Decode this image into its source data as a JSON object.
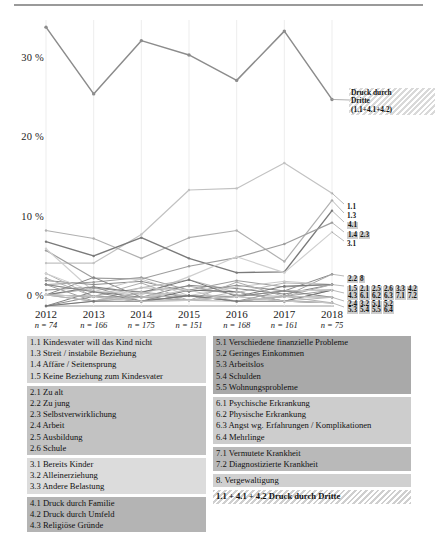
{
  "chart_data": {
    "type": "line",
    "title": "",
    "xlabel": "",
    "ylabel": "",
    "ylim": [
      0,
      36
    ],
    "yticks": [
      0,
      10,
      20,
      30
    ],
    "ytick_labels": [
      "0 %",
      "10 %",
      "20 %",
      "30 %"
    ],
    "grid": false,
    "legend_position": "below",
    "x": [
      "2012",
      "2013",
      "2014",
      "2015",
      "2016",
      "2017",
      "2018"
    ],
    "x_sublabels": [
      "n = 74",
      "n = 166",
      "n = 175",
      "n = 151",
      "n = 168",
      "n = 161",
      "n = 75"
    ],
    "annotations": [
      {
        "text_lines": [
          "Druck durch",
          "Dritte",
          "(1.1+4.1+4.2)"
        ],
        "points_to": "2018",
        "style": "hatched-box"
      }
    ],
    "end_labels": [
      {
        "codes": [
          "1.1"
        ],
        "value": 14.2,
        "style": "plain"
      },
      {
        "codes": [
          "1.3"
        ],
        "value": 13.3,
        "style": "plain"
      },
      {
        "codes": [
          "4.1"
        ],
        "value": 12.0,
        "style": "shaded"
      },
      {
        "codes": [
          "1.4",
          "2.3"
        ],
        "value": 10.5,
        "style": "shaded"
      },
      {
        "codes": [
          "3.1"
        ],
        "value": 9.3,
        "style": "plain"
      },
      {
        "codes": [
          "2.2",
          "8"
        ],
        "value": 4.0,
        "style": "shaded"
      },
      {
        "codes": [
          "1.5",
          "2.1",
          "2.5",
          "2.6",
          "3.3",
          "4.2"
        ],
        "value": 2.7,
        "style": "shaded"
      },
      {
        "codes": [
          "4.3",
          "6.1",
          "6.2",
          "6.3",
          "7.1",
          "7.2"
        ],
        "value": 2.0,
        "style": "shaded"
      },
      {
        "codes": [
          "2.4",
          "3.2",
          "5.1",
          "5.2"
        ],
        "value": 1.1,
        "style": "shaded"
      },
      {
        "codes": [
          "5.3",
          "5.4",
          "5.5",
          "6.4"
        ],
        "value": 0.4,
        "style": "shaded"
      }
    ],
    "series": [
      {
        "name": "Druck durch Dritte (1.1+4.1+4.2)",
        "color": "#8c8c8c",
        "width": 1.5,
        "values": [
          35.1,
          26.7,
          33.4,
          31.6,
          28.4,
          34.6,
          26.0
        ]
      },
      {
        "name": "1.1",
        "color": "#c2c2c2",
        "width": 1.2,
        "values": [
          5.4,
          5.4,
          9.0,
          14.6,
          14.8,
          18.0,
          14.2
        ]
      },
      {
        "name": "1.3",
        "color": "#b0b0b0",
        "width": 1.2,
        "values": [
          9.5,
          8.5,
          6.0,
          8.6,
          9.5,
          5.6,
          13.3
        ]
      },
      {
        "name": "4.1",
        "color": "#7a7a7a",
        "width": 1.4,
        "values": [
          8.1,
          6.3,
          8.6,
          6.0,
          4.2,
          4.3,
          12.0
        ]
      },
      {
        "name": "1.4 / 2.3",
        "color": "#9e9e9e",
        "width": 1.2,
        "values": [
          7.0,
          3.5,
          3.4,
          5.0,
          6.1,
          7.8,
          10.5
        ]
      },
      {
        "name": "3.1",
        "color": "#cfcfcf",
        "width": 1.2,
        "values": [
          7.2,
          1.8,
          1.4,
          3.7,
          6.2,
          4.2,
          9.3
        ]
      },
      {
        "name": "2.2",
        "color": "#8a8a8a",
        "width": 1.0,
        "values": [
          3.2,
          2.7,
          3.1,
          1.8,
          2.6,
          1.9,
          4.0
        ]
      },
      {
        "name": "8",
        "color": "#a5a5a5",
        "width": 1.0,
        "values": [
          1.4,
          2.2,
          1.8,
          2.5,
          1.4,
          1.2,
          4.0
        ]
      },
      {
        "name": "1.5",
        "color": "#9c9c9c",
        "width": 1.0,
        "values": [
          2.7,
          3.0,
          3.6,
          2.0,
          3.2,
          2.4,
          2.7
        ]
      },
      {
        "name": "2.1",
        "color": "#b5b5b5",
        "width": 1.0,
        "values": [
          4.1,
          1.2,
          2.3,
          3.3,
          1.7,
          2.9,
          2.7
        ]
      },
      {
        "name": "2.5",
        "color": "#868686",
        "width": 1.0,
        "values": [
          1.4,
          3.6,
          1.1,
          2.6,
          2.2,
          1.5,
          2.7
        ]
      },
      {
        "name": "2.6",
        "color": "#c8c8c8",
        "width": 1.0,
        "values": [
          2.7,
          1.8,
          3.4,
          1.3,
          2.4,
          3.1,
          2.7
        ]
      },
      {
        "name": "3.3",
        "color": "#777777",
        "width": 1.0,
        "values": [
          1.4,
          2.4,
          1.7,
          3.3,
          1.2,
          2.5,
          2.7
        ]
      },
      {
        "name": "4.2",
        "color": "#aeaeae",
        "width": 1.0,
        "values": [
          3.5,
          1.2,
          2.9,
          0.7,
          3.0,
          1.2,
          2.7
        ]
      },
      {
        "name": "4.3",
        "color": "#929292",
        "width": 1.0,
        "values": [
          2.0,
          2.4,
          0.6,
          1.3,
          0.6,
          1.9,
          2.0
        ]
      },
      {
        "name": "6.1",
        "color": "#bfbfbf",
        "width": 1.0,
        "values": [
          1.4,
          0.6,
          2.3,
          2.0,
          1.8,
          0.6,
          2.0
        ]
      },
      {
        "name": "6.2",
        "color": "#808080",
        "width": 1.0,
        "values": [
          0.0,
          1.8,
          1.1,
          0.7,
          1.2,
          1.9,
          2.0
        ]
      },
      {
        "name": "6.3",
        "color": "#a0a0a0",
        "width": 1.0,
        "values": [
          2.7,
          0.6,
          1.7,
          1.3,
          0.6,
          1.2,
          2.0
        ]
      },
      {
        "name": "7.1",
        "color": "#6e6e6e",
        "width": 1.0,
        "values": [
          1.4,
          1.2,
          0.6,
          2.0,
          1.8,
          0.6,
          2.0
        ]
      },
      {
        "name": "7.2",
        "color": "#d0d0d0",
        "width": 1.0,
        "values": [
          4.1,
          1.8,
          1.7,
          0.7,
          1.2,
          1.9,
          2.0
        ]
      },
      {
        "name": "2.4",
        "color": "#999999",
        "width": 1.0,
        "values": [
          1.4,
          1.2,
          1.1,
          1.3,
          0.6,
          1.2,
          1.1
        ]
      },
      {
        "name": "3.2",
        "color": "#b8b8b8",
        "width": 1.0,
        "values": [
          0.0,
          0.6,
          1.7,
          0.7,
          1.8,
          0.6,
          1.1
        ]
      },
      {
        "name": "5.1",
        "color": "#858585",
        "width": 1.0,
        "values": [
          2.7,
          1.8,
          0.6,
          1.3,
          1.2,
          1.9,
          1.1
        ]
      },
      {
        "name": "5.2",
        "color": "#c4c4c4",
        "width": 1.0,
        "values": [
          1.4,
          0.6,
          1.1,
          2.0,
          0.6,
          1.2,
          1.1
        ]
      },
      {
        "name": "5.3",
        "color": "#8f8f8f",
        "width": 1.0,
        "values": [
          0.0,
          1.2,
          0.6,
          0.7,
          1.2,
          0.6,
          0.4
        ]
      },
      {
        "name": "5.4",
        "color": "#b2b2b2",
        "width": 1.0,
        "values": [
          1.4,
          0.6,
          1.1,
          0.7,
          0.6,
          1.2,
          0.4
        ]
      },
      {
        "name": "5.5",
        "color": "#757575",
        "width": 1.0,
        "values": [
          0.0,
          0.6,
          0.6,
          1.3,
          0.6,
          0.6,
          0.4
        ]
      },
      {
        "name": "6.4",
        "color": "#cacaca",
        "width": 1.0,
        "values": [
          1.4,
          1.2,
          0.6,
          0.7,
          1.2,
          0.6,
          0.4
        ]
      }
    ]
  },
  "legend": {
    "left_column": [
      {
        "shade": "b1",
        "rows": [
          "1.1 Kindesvater will das Kind nicht",
          "1.3 Streit / instabile Beziehung",
          "1.4 Affäre / Seitensprung",
          "1.5 Keine Beziehung zum Kindesvater"
        ]
      },
      {
        "shade": "b2",
        "rows": [
          "2.1 Zu alt",
          "2.2 Zu jung",
          "2.3 Selbstverwirklichung",
          "2.4 Arbeit",
          "2.5 Ausbildung",
          "2.6 Schule"
        ]
      },
      {
        "shade": "b3",
        "rows": [
          "3.1 Bereits Kinder",
          "3.2 Alleinerziehung",
          "3.3 Andere Belastung"
        ]
      },
      {
        "shade": "b4",
        "rows": [
          "4.1 Druck durch Familie",
          "4.2 Druck durch Umfeld",
          "4.3 Religiöse Gründe"
        ]
      }
    ],
    "right_column": [
      {
        "shade": "b5",
        "rows": [
          "5.1 Verschiedene finanzielle Probleme",
          "5.2 Geringes Einkommen",
          "5.3 Arbeitslos",
          "5.4 Schulden",
          "5.5 Wohnungsprobleme"
        ]
      },
      {
        "shade": "b6",
        "rows": [
          "6.1 Psychische Erkrankung",
          "6.2 Physische Erkrankung",
          "6.3 Angst wg. Erfahrungen / Komplikationen",
          "6.4 Mehrlinge"
        ]
      },
      {
        "shade": "b7",
        "rows": [
          "7.1 Vermutete Krankheit",
          "7.2 Diagnostizierte Krankheit"
        ]
      },
      {
        "shade": "b8",
        "rows": [
          "8. Vergewaltigung"
        ]
      },
      {
        "shade": "hatch",
        "rows": [
          "1.1 + 4.1 + 4.2 Druck durch Dritte"
        ]
      }
    ]
  }
}
